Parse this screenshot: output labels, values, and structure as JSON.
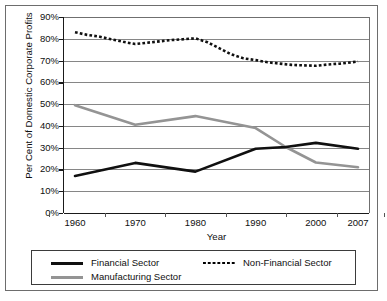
{
  "chart_data": {
    "type": "line",
    "title": "",
    "xlabel": "Year",
    "ylabel": "Per Cent of Domestic Corporate Profits",
    "x": [
      1960,
      1970,
      1980,
      1990,
      2000,
      2007
    ],
    "xlim": [
      1960,
      2007
    ],
    "ylim": [
      0,
      90
    ],
    "grid": true,
    "legend_position": "bottom",
    "xtick_labels": [
      "1960",
      "1970",
      "1980",
      "1990",
      "2000",
      "2007"
    ],
    "ytick_labels": [
      "90%",
      "80%",
      "70%",
      "60%",
      "50%",
      "40%",
      "30%",
      "20%",
      "10%",
      "0%"
    ],
    "ytick_values": [
      90,
      80,
      70,
      60,
      50,
      40,
      30,
      20,
      10,
      0
    ],
    "series": [
      {
        "name": "Financial Sector",
        "style": "solid",
        "color": "#101010",
        "width": 2.6,
        "values": [
          17.0,
          23.0,
          19.0,
          29.5,
          32.2,
          29.5
        ],
        "points": [
          [
            1960,
            17.0
          ],
          [
            1970,
            23.0
          ],
          [
            1980,
            19.0
          ],
          [
            1990,
            29.5
          ],
          [
            1995,
            30.3
          ],
          [
            2000,
            32.2
          ],
          [
            2007,
            29.5
          ]
        ]
      },
      {
        "name": "Non-Financial Sector",
        "style": "dotted",
        "color": "#101010",
        "width": 2.6,
        "values": [
          83.0,
          77.6,
          80.2,
          70.2,
          67.6,
          69.6
        ],
        "points": [
          [
            1960,
            83.0
          ],
          [
            1962,
            81.8
          ],
          [
            1964,
            81.0
          ],
          [
            1966,
            79.8
          ],
          [
            1968,
            78.6
          ],
          [
            1970,
            77.6
          ],
          [
            1972,
            78.2
          ],
          [
            1974,
            78.8
          ],
          [
            1976,
            79.4
          ],
          [
            1978,
            79.8
          ],
          [
            1980,
            80.2
          ],
          [
            1982,
            78.4
          ],
          [
            1984,
            75.6
          ],
          [
            1986,
            72.8
          ],
          [
            1988,
            71.0
          ],
          [
            1990,
            70.2
          ],
          [
            1992,
            69.2
          ],
          [
            1994,
            68.6
          ],
          [
            1996,
            68.0
          ],
          [
            1998,
            67.8
          ],
          [
            2000,
            67.6
          ],
          [
            2002,
            68.2
          ],
          [
            2004,
            68.6
          ],
          [
            2006,
            69.2
          ],
          [
            2007,
            69.6
          ]
        ]
      },
      {
        "name": "Manufacturing Sector",
        "style": "solid",
        "color": "#949494",
        "width": 2.6,
        "values": [
          49.5,
          40.5,
          44.5,
          39.0,
          23.2,
          21.0
        ],
        "points": [
          [
            1960,
            49.5
          ],
          [
            1970,
            40.5
          ],
          [
            1980,
            44.5
          ],
          [
            1990,
            39.0
          ],
          [
            1995,
            30.3
          ],
          [
            2000,
            23.2
          ],
          [
            2007,
            21.0
          ]
        ]
      }
    ]
  },
  "legend": {
    "entries": [
      {
        "label": "Financial Sector",
        "style": "solid",
        "color": "#101010"
      },
      {
        "label": "Non-Financial Sector",
        "style": "dotted",
        "color": "#101010"
      },
      {
        "label": "Manufacturing Sector",
        "style": "solid",
        "color": "#949494"
      }
    ]
  }
}
